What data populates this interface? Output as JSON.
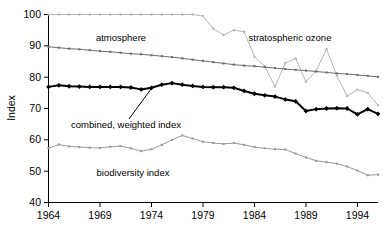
{
  "chart_data": {
    "type": "line",
    "title": "",
    "xlabel": "",
    "ylabel": "Index",
    "xlim": [
      1964,
      1996
    ],
    "ylim": [
      40,
      100
    ],
    "grid": false,
    "legend_position": "inline-annotations",
    "xticks": [
      1964,
      1969,
      1974,
      1979,
      1984,
      1989,
      1994
    ],
    "xtick_labels": [
      "1964",
      "1969",
      "1974",
      "1979",
      "1984",
      "1989",
      "1994"
    ],
    "yticks": [
      40,
      50,
      60,
      70,
      80,
      90,
      100
    ],
    "ytick_labels": [
      "40",
      "50",
      "60",
      "70",
      "80",
      "90",
      "100"
    ],
    "x": [
      1964,
      1965,
      1966,
      1967,
      1968,
      1969,
      1970,
      1971,
      1972,
      1973,
      1974,
      1975,
      1976,
      1977,
      1978,
      1979,
      1980,
      1981,
      1982,
      1983,
      1984,
      1985,
      1986,
      1987,
      1988,
      1989,
      1990,
      1991,
      1992,
      1993,
      1994,
      1995,
      1996
    ],
    "series": [
      {
        "name": "stratospheric ozone",
        "color": "#b5b5b5",
        "marker": "small-square",
        "line_width": 1,
        "values": [
          100,
          100,
          100,
          100,
          100,
          100,
          100,
          100,
          100,
          100,
          100,
          100,
          100,
          100,
          100,
          99.5,
          95.5,
          93.5,
          95.0,
          94.5,
          86.5,
          83.5,
          77.0,
          84.5,
          86.0,
          78.5,
          82.0,
          89.0,
          80.5,
          74.0,
          76.0,
          75.0,
          71.0
        ]
      },
      {
        "name": "atmosphere",
        "color": "#6e6e6e",
        "marker": "small-square",
        "line_width": 1,
        "values": [
          89.7,
          89.4,
          89.1,
          88.9,
          88.6,
          88.3,
          88.1,
          87.8,
          87.5,
          87.3,
          87.0,
          86.7,
          86.4,
          86.0,
          85.6,
          85.2,
          84.8,
          84.4,
          84.0,
          83.7,
          83.5,
          83.2,
          82.9,
          82.6,
          82.3,
          82.1,
          81.8,
          81.5,
          81.2,
          81.0,
          80.7,
          80.4,
          80.1
        ]
      },
      {
        "name": "combined, weighted index",
        "color": "#000000",
        "marker": "filled-diamond",
        "line_width": 2,
        "values": [
          76.9,
          77.4,
          77.1,
          77.0,
          76.9,
          76.9,
          76.9,
          76.9,
          76.7,
          76.1,
          76.6,
          77.6,
          78.1,
          77.6,
          77.2,
          76.9,
          76.8,
          76.8,
          76.6,
          75.6,
          74.7,
          74.2,
          73.8,
          72.9,
          72.3,
          69.2,
          69.8,
          70.0,
          70.1,
          70.0,
          68.1,
          69.8,
          68.3
        ]
      },
      {
        "name": "biodiversity index",
        "color": "#9a9a9a",
        "marker": "small-square",
        "line_width": 1,
        "values": [
          57.3,
          58.5,
          57.9,
          57.7,
          57.5,
          57.4,
          57.8,
          58.0,
          57.3,
          56.4,
          57.0,
          58.4,
          60.0,
          61.4,
          60.4,
          59.4,
          59.0,
          58.7,
          59.0,
          58.4,
          57.7,
          57.3,
          57.0,
          56.9,
          55.6,
          54.4,
          53.3,
          52.9,
          52.4,
          51.5,
          50.2,
          48.7,
          48.9
        ]
      }
    ],
    "annotations": [
      {
        "name": "atmosphere",
        "text": "atmosphere",
        "x_px": 121,
        "y_px": 41
      },
      {
        "name": "stratospheric-ozone",
        "text": "stratospheric ozone",
        "x_px": 290,
        "y_px": 41
      },
      {
        "name": "combined-weighted-index",
        "text": "combined, weighted index",
        "x_px": 126,
        "y_px": 128
      },
      {
        "name": "biodiversity-index",
        "text": "biodiversity index",
        "x_px": 133,
        "y_px": 176
      }
    ],
    "leader_line": {
      "from_px": [
        129,
        119
      ],
      "to_px": [
        151,
        89
      ]
    }
  },
  "axes": {
    "y_axis_title": "Index",
    "x_axis_title": ""
  }
}
